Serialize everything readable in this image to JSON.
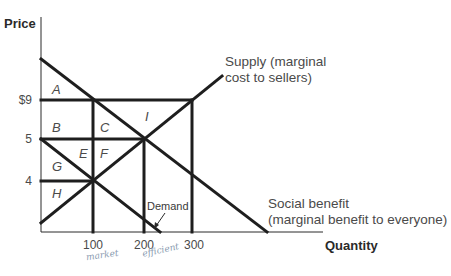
{
  "axes": {
    "y_title": "Price",
    "x_title": "Quantity",
    "y_ticks": [
      "$9",
      "5",
      "4"
    ],
    "x_ticks": [
      "100",
      "200",
      "300"
    ]
  },
  "curves": {
    "supply_line1": "Supply (marginal",
    "supply_line2": "cost to sellers)",
    "social_line1": "Social benefit",
    "social_line2": "(marginal benefit to everyone)",
    "demand": "Demand"
  },
  "regions": [
    "A",
    "B",
    "C",
    "I",
    "E",
    "F",
    "G",
    "H"
  ],
  "handwriting": {
    "under_100": "market",
    "under_200": "efficient"
  },
  "colors": {
    "line": "#1e1e1e",
    "text": "#3a3a3a",
    "handwriting": "#8a9bb0"
  },
  "chart_data": {
    "type": "line",
    "title": "",
    "xlabel": "Quantity",
    "ylabel": "Price",
    "x_ticks": [
      100,
      200,
      300
    ],
    "y_ticks": [
      4,
      5,
      9
    ],
    "grid": false,
    "series": [
      {
        "name": "Supply (marginal cost to sellers)",
        "points": [
          [
            0,
            3
          ],
          [
            100,
            4
          ],
          [
            200,
            5
          ],
          [
            300,
            9
          ]
        ]
      },
      {
        "name": "Social benefit (marginal benefit to everyone)",
        "points": [
          [
            0,
            11
          ],
          [
            100,
            9
          ],
          [
            200,
            5
          ],
          [
            300,
            3
          ]
        ]
      },
      {
        "name": "Demand",
        "points": [
          [
            0,
            5
          ],
          [
            100,
            4
          ],
          [
            230,
            0
          ]
        ]
      }
    ],
    "reference_lines": [
      {
        "type": "horizontal",
        "y": 9,
        "x_range": [
          0,
          300
        ]
      },
      {
        "type": "horizontal",
        "y": 5,
        "x_range": [
          0,
          200
        ]
      },
      {
        "type": "horizontal",
        "y": 4,
        "x_range": [
          0,
          100
        ]
      },
      {
        "type": "vertical",
        "x": 100,
        "y_range": [
          0,
          9
        ]
      },
      {
        "type": "vertical",
        "x": 200,
        "y_range": [
          0,
          5
        ]
      },
      {
        "type": "vertical",
        "x": 300,
        "y_range": [
          0,
          9
        ]
      }
    ],
    "region_labels": [
      "A",
      "B",
      "C",
      "E",
      "F",
      "G",
      "H",
      "I"
    ],
    "annotations": [
      "Demand (arrow)",
      "market (handwritten under 100)",
      "efficient (handwritten under 200)"
    ],
    "render": {
      "axis": [
        [
          41,
          17
        ],
        [
          41,
          232
        ],
        [
          323,
          232
        ]
      ],
      "segments": [
        [
          41,
          223,
          222,
          76
        ],
        [
          41,
          59,
          267,
          232
        ],
        [
          41,
          139,
          160,
          232
        ],
        [
          41,
          100,
          192,
          100
        ],
        [
          41,
          139,
          144,
          139
        ],
        [
          41,
          181,
          93,
          181
        ],
        [
          93,
          100,
          93,
          232
        ],
        [
          144,
          139,
          144,
          232
        ],
        [
          192,
          100,
          192,
          232
        ]
      ]
    }
  }
}
